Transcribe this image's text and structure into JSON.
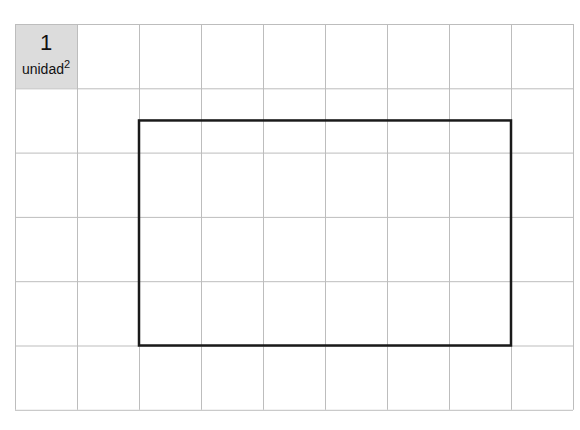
{
  "diagram": {
    "grid": {
      "columns": 9,
      "rows": 6,
      "cell_width": 62,
      "cell_height": 64.3,
      "line_color": "#bdbdbd"
    },
    "unit_square": {
      "value": "1",
      "label": "unidad",
      "exponent": "2",
      "fill": "#dcdcdc"
    },
    "rectangle": {
      "col_start": 2,
      "col_end": 8,
      "row_start": 1.5,
      "row_end": 5,
      "width_units": 6,
      "height_units": 3.5,
      "stroke": "#1a1a1a"
    }
  }
}
